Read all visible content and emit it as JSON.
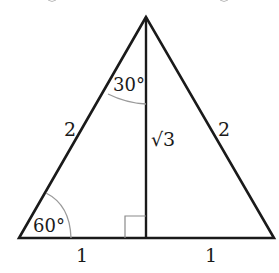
{
  "diagram": {
    "vertices": {
      "apex": [
        146,
        17
      ],
      "bottom_left": [
        19,
        238
      ],
      "bottom_right": [
        274,
        238
      ],
      "altitude_foot": [
        146,
        238
      ]
    },
    "labels": {
      "left_side": "2",
      "right_side": "2",
      "altitude": "√3",
      "base_left": "1",
      "base_right": "1",
      "angle_top": "30°",
      "angle_bottom_left": "60°"
    },
    "colors": {
      "line": "#1a1a1a",
      "arc": "#9a9a9a",
      "right_angle_mark": "#8a8a8a",
      "background": "#ffffff"
    }
  }
}
